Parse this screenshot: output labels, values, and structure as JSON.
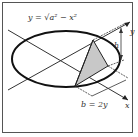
{
  "diagram": {
    "equation_label": "y = √a² − x²",
    "height_label": "h",
    "base_label": "b = 2y",
    "x_axis_label": "x",
    "y_axis_label": "y",
    "colors": {
      "stroke": "#222222",
      "shade": "#c8c8c8",
      "border": "#555555",
      "background": "#ffffff"
    }
  }
}
